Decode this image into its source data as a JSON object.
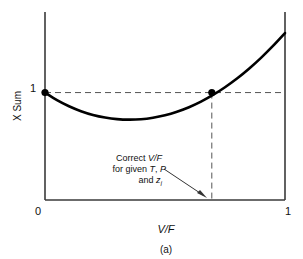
{
  "chart_data": {
    "type": "line",
    "title": "",
    "caption": "(a)",
    "xlabel": "V/F",
    "ylabel": "X Sum",
    "xlim": [
      0,
      1
    ],
    "ylim": [
      0,
      1.75
    ],
    "grid": false,
    "legend": null,
    "x_ticks": [
      "0",
      "1"
    ],
    "x_tick_values": [
      0,
      1
    ],
    "y_ticks": [
      "1"
    ],
    "y_tick_values": [
      1
    ],
    "series": [
      {
        "name": "X Sum vs V/F",
        "style": "solid-thick-black",
        "color": "#000000",
        "x": [
          0.0,
          0.05,
          0.1,
          0.15,
          0.2,
          0.25,
          0.3,
          0.35,
          0.4,
          0.45,
          0.5,
          0.55,
          0.6,
          0.65,
          0.7,
          0.75,
          0.8,
          0.85,
          0.9,
          0.95,
          1.0
        ],
        "y": [
          1.0,
          0.93,
          0.873,
          0.827,
          0.792,
          0.768,
          0.753,
          0.748,
          0.752,
          0.766,
          0.789,
          0.822,
          0.864,
          0.916,
          0.978,
          1.05,
          1.131,
          1.222,
          1.323,
          1.434,
          1.554
        ]
      }
    ],
    "markers": [
      {
        "name": "left-endpoint",
        "x": 0.0,
        "y": 1.0,
        "style": "filled-circle",
        "color": "#000000"
      },
      {
        "name": "solution-point",
        "x": 0.695,
        "y": 1.0,
        "style": "filled-circle",
        "color": "#000000"
      }
    ],
    "reference_lines": [
      {
        "name": "horizontal-unity-line",
        "orientation": "horizontal",
        "value": 1.0,
        "style": "dashed",
        "color": "#555555"
      },
      {
        "name": "vertical-solution-line",
        "orientation": "vertical",
        "value": 0.695,
        "style": "dashed",
        "color": "#555555"
      }
    ],
    "annotations": [
      {
        "name": "correct-vf-annotation",
        "lines": [
          {
            "plain_before": "Correct ",
            "italic": "V/F",
            "plain_after": ""
          },
          {
            "plain_before": "for given ",
            "italic": "T",
            "plain_mid": ", ",
            "italic2": "P",
            "plain_after": ""
          },
          {
            "plain_before": "and ",
            "italic": "z",
            "subscript": "i",
            "plain_after": ""
          }
        ],
        "text": "Correct V/F for given T, P and z_i",
        "points_to_x": 0.695,
        "points_to_y": 0.0,
        "arrow": true
      }
    ],
    "colors": {
      "curve": "#000000",
      "axis": "#3a3a3a",
      "dashed": "#555555",
      "text": "#111111",
      "background": "#ffffff"
    }
  },
  "axis": {
    "x_tick_left": "0",
    "x_tick_right": "1",
    "y_tick_one": "1",
    "x_title": "V/F",
    "y_title": "X Sum"
  },
  "annotation": {
    "line1_plain": "Correct ",
    "line1_italic": "V/F",
    "line2_plain": "for given ",
    "line2_italic_t": "T",
    "line2_comma": ", ",
    "line2_italic_p": "P",
    "line3_plain": "and ",
    "line3_italic_z": "z",
    "line3_sub_i": "i"
  },
  "caption": {
    "text": "(a)"
  }
}
